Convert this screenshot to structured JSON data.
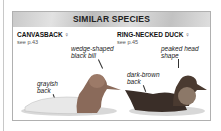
{
  "panel": {
    "title": "SIMILAR SPECIES",
    "species": [
      {
        "name": "CANVASBACK",
        "sex_symbol": "♀",
        "ref": "see p.43",
        "notes": [
          "wedge-shaped black bill",
          "grayish back"
        ]
      },
      {
        "name": "RING-NECKED DUCK",
        "sex_symbol": "♀",
        "ref": "see p.45",
        "notes": [
          "peaked head shape",
          "dark-brown back"
        ]
      }
    ]
  }
}
